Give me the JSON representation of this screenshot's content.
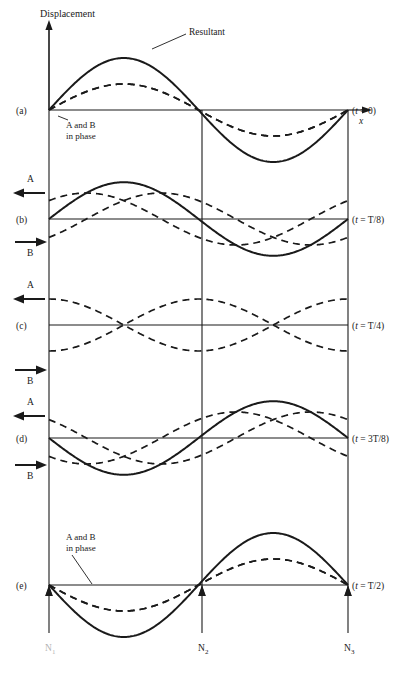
{
  "figure": {
    "title_axis_y": "Displacement",
    "axis_x_label": "x",
    "resultant_label": "Resultant",
    "in_phase_label_line1": "A and B",
    "in_phase_label_line2": "in phase",
    "wave_a_label": "A",
    "wave_b_label": "B",
    "node_labels": [
      "N",
      "N",
      "N"
    ],
    "node_subscripts": [
      "1",
      "2",
      "3"
    ],
    "stroke_color": "#1a1a1a",
    "background": "#ffffff"
  },
  "rows": [
    {
      "key": "a",
      "row_label": "(a)",
      "time_label": "(t = 0)",
      "baseline_y": 110,
      "show_resultant": true,
      "show_in_phase_note": true,
      "in_phase_note_x": 66,
      "in_phase_note_y": 128,
      "arrows": [],
      "phase_deg": 0
    },
    {
      "key": "b",
      "row_label": "(b)",
      "time_label": "(t = T/8)",
      "baseline_y": 219,
      "show_resultant": true,
      "show_in_phase_note": false,
      "arrows": [
        {
          "name": "wave-a",
          "label": "A",
          "direction": "left",
          "y": 193,
          "label_y": 182
        },
        {
          "name": "wave-b",
          "label": "B",
          "direction": "right",
          "y": 242,
          "label_y": 256
        }
      ],
      "phase_deg": 45
    },
    {
      "key": "c",
      "row_label": "(c)",
      "time_label": "(t = T/4)",
      "baseline_y": 325,
      "show_resultant": false,
      "show_in_phase_note": false,
      "arrows": [
        {
          "name": "wave-a",
          "label": "A",
          "direction": "left",
          "y": 299,
          "label_y": 288
        },
        {
          "name": "wave-b",
          "label": "B",
          "direction": "right",
          "y": 370,
          "label_y": 384
        }
      ],
      "phase_deg": 90
    },
    {
      "key": "d",
      "row_label": "(d)",
      "time_label": "(t = 3T/8)",
      "baseline_y": 438,
      "show_resultant": true,
      "show_in_phase_note": false,
      "arrows": [
        {
          "name": "wave-a",
          "label": "A",
          "direction": "left",
          "y": 416,
          "label_y": 405
        },
        {
          "name": "wave-b",
          "label": "B",
          "direction": "right",
          "y": 465,
          "label_y": 479
        }
      ],
      "phase_deg": 135
    },
    {
      "key": "e",
      "row_label": "(e)",
      "time_label": "(t = T/2)",
      "baseline_y": 585,
      "show_resultant": true,
      "show_in_phase_note": true,
      "in_phase_note_x": 66,
      "in_phase_note_y": 540,
      "arrows": [],
      "phase_deg": 180
    }
  ],
  "chart_data": {
    "type": "line",
    "xlabel": "x",
    "ylabel": "Displacement",
    "x_range": [
      49,
      348
    ],
    "node_positions_x": [
      49,
      202,
      348
    ],
    "component_amplitude": 26,
    "resultant_amplitude": 52,
    "wavelength_px": 299,
    "series": [
      {
        "name": "A",
        "style": "dashed",
        "direction": "left",
        "amplitude": 26
      },
      {
        "name": "B",
        "style": "dashed",
        "direction": "right",
        "amplitude": 26
      },
      {
        "name": "Resultant",
        "style": "solid",
        "amplitude": 52
      }
    ],
    "times": [
      "0",
      "T/8",
      "T/4",
      "3T/8",
      "T/2"
    ],
    "legend": "inline-annotations",
    "grid": false
  }
}
